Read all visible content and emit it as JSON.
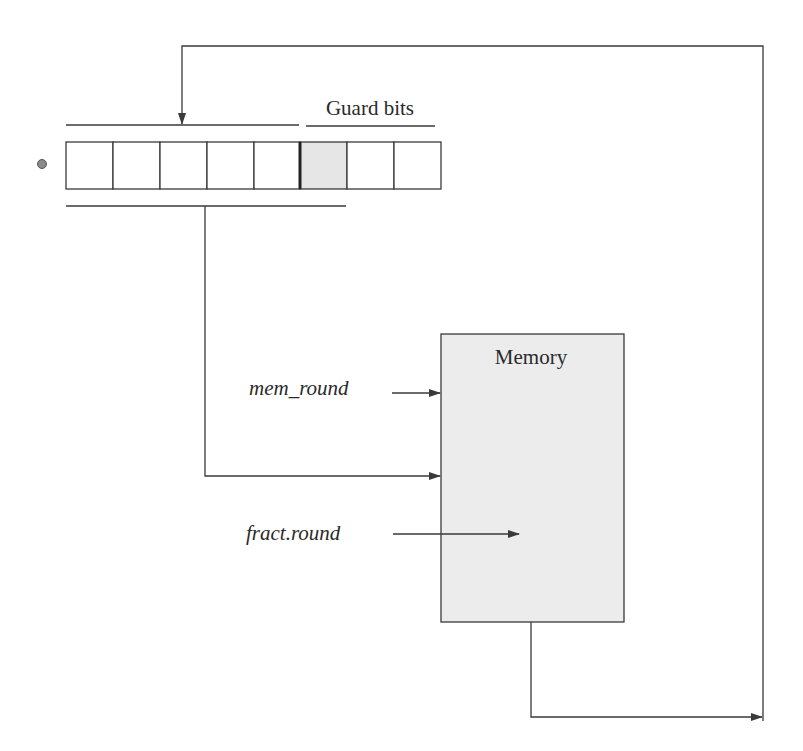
{
  "diagram": {
    "register": {
      "cells": 8,
      "guard_cell_index": 5,
      "guard_label": "Guard bits",
      "radix_point": "binary-point-dot"
    },
    "memory": {
      "label": "Memory"
    },
    "signals": {
      "mem_round": "mem_round",
      "fract_round": "fract.round"
    },
    "colors": {
      "line": "#3a3a3a",
      "fill_guard": "#e6e6e6",
      "fill_memory": "#ececec",
      "dot": "#8a8a8a"
    }
  }
}
